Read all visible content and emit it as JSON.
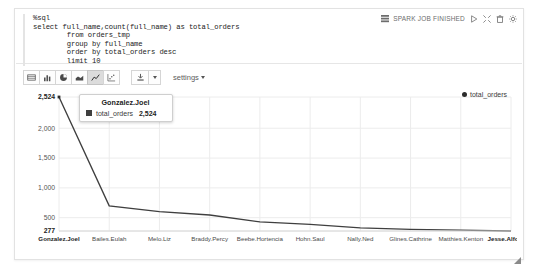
{
  "editor": {
    "code_lines": [
      "%sql",
      "select full_name,count(full_name) as total_orders",
      "        from orders_tmp",
      "        group by full_name",
      "        order by total_orders desc",
      "        limit 10"
    ]
  },
  "job_status": {
    "label": "SPARK JOB FINISHED",
    "icons": [
      "grid-icon",
      "play-icon",
      "expand-icon",
      "trash-icon",
      "gear-icon"
    ]
  },
  "toolbar": {
    "chart_types": [
      {
        "name": "table-view",
        "label": "Table"
      },
      {
        "name": "bar-chart",
        "label": "Bar Chart"
      },
      {
        "name": "pie-chart",
        "label": "Pie Chart"
      },
      {
        "name": "area-chart",
        "label": "Area Chart"
      },
      {
        "name": "line-chart",
        "label": "Line Chart",
        "active": true
      },
      {
        "name": "scatter-chart",
        "label": "Scatter Chart"
      }
    ],
    "download_label": "Download",
    "settings_label": "settings"
  },
  "tooltip": {
    "title": "Gonzalez.Joel",
    "series_label": "total_orders",
    "value": "2,524"
  },
  "legend": {
    "entries": [
      {
        "label": "total_orders",
        "color": "#2b2b2b"
      }
    ]
  },
  "chart_data": {
    "type": "line",
    "title": "",
    "xlabel": "",
    "ylabel": "",
    "categories": [
      "Gonzalez.Joel",
      "Bailes.Eulah",
      "Melo.Liz",
      "Braddy.Percy",
      "Beebe.Hortencia",
      "Hohn.Saul",
      "Nally.Ned",
      "Glines.Cathrine",
      "Matthies.Kenton",
      "Jesse.Alfo"
    ],
    "series": [
      {
        "name": "total_orders",
        "color": "#3f3f3f",
        "values": [
          2524,
          700,
          600,
          545,
          430,
          390,
          330,
          305,
          290,
          277
        ]
      }
    ],
    "ylim": [
      277,
      2524
    ],
    "yticks": [
      "2,524",
      "2,000",
      "1,500",
      "1,000",
      "500",
      "277"
    ],
    "ytick_values": [
      2524,
      2000,
      1500,
      1000,
      500,
      277
    ],
    "grid": true,
    "legend_position": "top-right"
  }
}
